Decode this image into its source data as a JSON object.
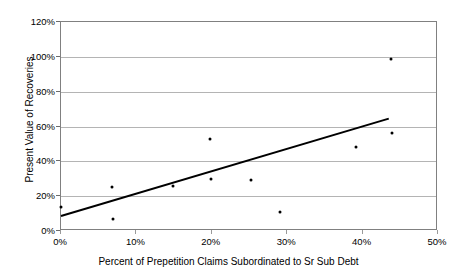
{
  "chart_data": {
    "type": "scatter",
    "title": "",
    "xlabel": "Percent of Prepetition Claims Subordinated to Sr Sub Debt",
    "ylabel": "Present Value of Recoveries",
    "xlim": [
      0,
      50
    ],
    "ylim": [
      0,
      120
    ],
    "xticks": [
      "0%",
      "10%",
      "20%",
      "30%",
      "40%",
      "50%"
    ],
    "xtick_values": [
      0,
      10,
      20,
      30,
      40,
      50
    ],
    "yticks": [
      "0%",
      "20%",
      "40%",
      "60%",
      "80%",
      "100%",
      "120%"
    ],
    "ytick_values": [
      0,
      20,
      40,
      60,
      80,
      100,
      120
    ],
    "grid": "horizontal",
    "legend": "none",
    "marker_color": "#000000",
    "gridline_color": "#b4b4b4",
    "axis_color": "#808080",
    "trendline_color": "#000000",
    "series": [
      {
        "name": "Present Value of Recoveries",
        "points": [
          {
            "x": 0.0,
            "y": 14
          },
          {
            "x": 6.8,
            "y": 25
          },
          {
            "x": 6.9,
            "y": 7
          },
          {
            "x": 14.8,
            "y": 26
          },
          {
            "x": 19.7,
            "y": 53
          },
          {
            "x": 19.9,
            "y": 30
          },
          {
            "x": 25.2,
            "y": 29
          },
          {
            "x": 29.0,
            "y": 11
          },
          {
            "x": 39.1,
            "y": 48
          },
          {
            "x": 43.8,
            "y": 99
          },
          {
            "x": 43.9,
            "y": 56
          }
        ]
      }
    ],
    "trendline": {
      "name": "linear-trend",
      "x0": 0.0,
      "y0": 7.5,
      "x1": 43.7,
      "y1": 64.0
    }
  }
}
